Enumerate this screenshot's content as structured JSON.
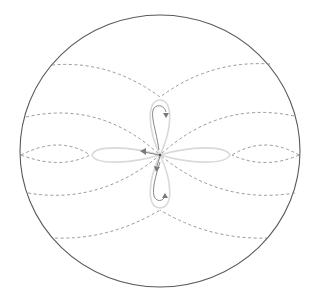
{
  "diagram": {
    "boundary": {
      "cx": 160,
      "cy": 151,
      "rx": 140,
      "ry": 136,
      "color": "#5a5a5a"
    },
    "center": {
      "x": 160,
      "y": 155
    },
    "colors": {
      "dashed_lines": "#8c8c8c",
      "lobes": "#d9d9d9",
      "flow_arrows": "#7a7a7a"
    },
    "lobes": [
      "top",
      "bottom",
      "left",
      "right"
    ],
    "arrows": [
      {
        "lobe": "top",
        "direction": "down"
      },
      {
        "lobe": "bottom",
        "direction": "up"
      },
      {
        "lobe": "center",
        "direction": "left"
      },
      {
        "lobe": "center",
        "direction": "down"
      }
    ]
  }
}
